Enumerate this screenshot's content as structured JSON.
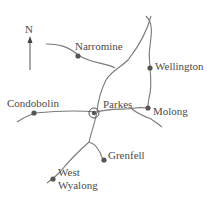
{
  "map": {
    "north_label": "N",
    "towns": [
      {
        "name": "Narromine",
        "x": 79,
        "y": 55
      },
      {
        "name": "Wellington",
        "x": 150,
        "y": 68
      },
      {
        "name": "Condobolin",
        "x": 32,
        "y": 113
      },
      {
        "name": "Parkes",
        "x": 122,
        "y": 111
      },
      {
        "name": "Molong",
        "x": 150,
        "y": 108
      },
      {
        "name": "Grenfell",
        "x": 104,
        "y": 156
      },
      {
        "name": "West",
        "x": 58,
        "y": 173
      },
      {
        "name": "Wyalong",
        "x": 58,
        "y": 185
      }
    ],
    "colors": {
      "road": "#7a7a7a",
      "town": "#555555",
      "text": "#4a4a4a"
    }
  }
}
